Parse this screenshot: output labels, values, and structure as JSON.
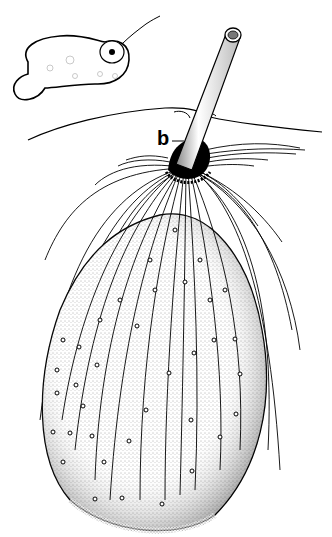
{
  "figure": {
    "labels": [
      {
        "id": "b",
        "text": "b"
      }
    ],
    "colors": {
      "ink": "#000000",
      "paper": "#ffffff",
      "stipple": "#9a9a9a"
    }
  }
}
